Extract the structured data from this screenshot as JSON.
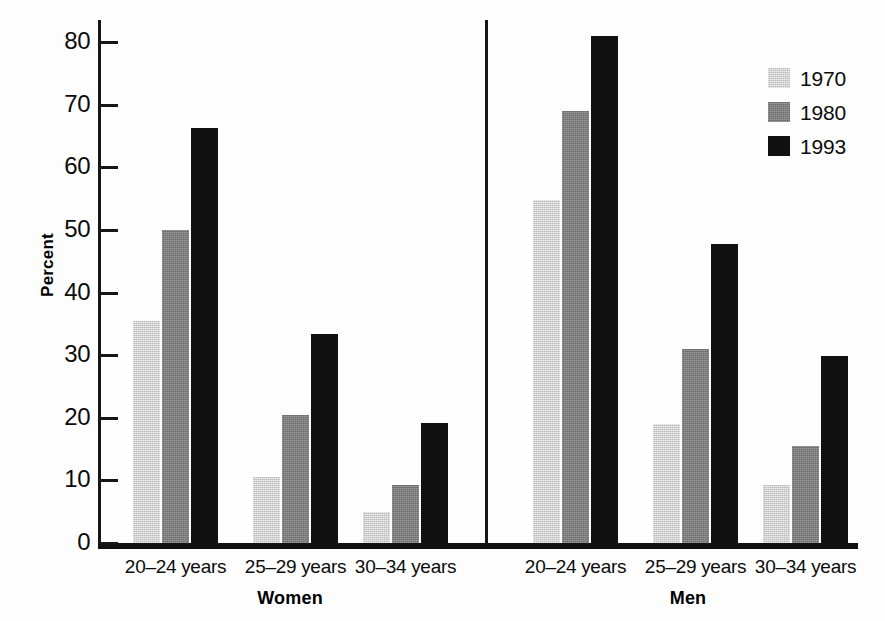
{
  "chart_data": {
    "type": "bar",
    "title": "",
    "xlabel": "",
    "ylabel": "Percent",
    "ylim": [
      0,
      80
    ],
    "yticks": [
      0,
      10,
      20,
      30,
      40,
      50,
      60,
      70,
      80
    ],
    "ytick_labels": [
      "0",
      "10",
      "20",
      "30",
      "40",
      "50",
      "60",
      "70",
      "80"
    ],
    "grid": false,
    "legend_position": "top-right",
    "panels": [
      "Women",
      "Men"
    ],
    "categories": [
      "20–24 years",
      "25–29 years",
      "30–34 years"
    ],
    "series": [
      {
        "name": "1970",
        "color": "#b9b9b9",
        "values": {
          "Women": [
            35.4,
            10.5,
            4.9
          ],
          "Men": [
            54.8,
            19.0,
            9.3
          ]
        }
      },
      {
        "name": "1980",
        "color": "#6b6b6b",
        "values": {
          "Women": [
            50.0,
            20.4,
            9.2
          ],
          "Men": [
            69.0,
            31.0,
            15.5
          ]
        }
      },
      {
        "name": "1993",
        "color": "#111111",
        "values": {
          "Women": [
            66.3,
            33.3,
            19.1
          ],
          "Men": [
            81.0,
            47.7,
            29.9
          ]
        }
      }
    ]
  },
  "axis": {
    "y_title": "Percent"
  },
  "legend": {
    "entries": [
      {
        "label": "1970",
        "swatch": "c1970"
      },
      {
        "label": "1980",
        "swatch": "c1980"
      },
      {
        "label": "1993",
        "swatch": "c1993"
      }
    ]
  },
  "panels": [
    {
      "name": "Women",
      "label": "Women"
    },
    {
      "name": "Men",
      "label": "Men"
    }
  ]
}
